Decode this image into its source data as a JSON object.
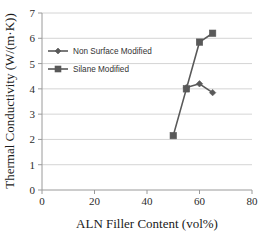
{
  "chart_data": {
    "type": "line",
    "title": "",
    "xlabel": "ALN Filler Content (vol%)",
    "ylabel": "Thermal Conductivity (W/(m·K))",
    "xlim": [
      0,
      80
    ],
    "ylim": [
      0,
      7
    ],
    "xticks": [
      0,
      20,
      40,
      60,
      80
    ],
    "yticks": [
      0,
      1,
      2,
      3,
      4,
      5,
      6,
      7
    ],
    "xtick_labels": [
      "0",
      "20",
      "40",
      "60",
      "80"
    ],
    "ytick_labels": [
      "0",
      "1",
      "2",
      "3",
      "4",
      "5",
      "6",
      "7"
    ],
    "grid": "horizontal",
    "legend_position": "upper-left-inside",
    "series": [
      {
        "name": "Non Surface Modified",
        "marker": "diamond",
        "color": "#595959",
        "x": [
          55,
          60,
          65
        ],
        "y": [
          4.05,
          4.2,
          3.85
        ]
      },
      {
        "name": "Silane Modified",
        "marker": "square",
        "color": "#595959",
        "x": [
          50,
          55,
          60,
          65
        ],
        "y": [
          2.15,
          4.0,
          5.85,
          6.2
        ]
      }
    ]
  },
  "legend": {
    "items": [
      {
        "label": "Non Surface Modified"
      },
      {
        "label": "Silane Modified"
      }
    ]
  },
  "axes": {
    "x_title": "ALN Filler Content (vol%)",
    "y_title": "Thermal Conductivity (W/(m·K))"
  },
  "colors": {
    "series": "#595959",
    "grid": "#c9c9c9",
    "axis": "#9a9a9a",
    "text": "#1a1a1a",
    "background": "#ffffff"
  }
}
